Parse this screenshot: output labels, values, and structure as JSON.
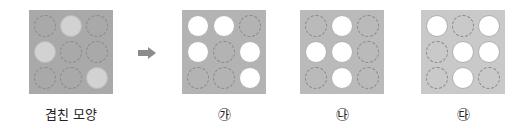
{
  "panels": [
    {
      "id": "overlap",
      "label": "겹친 모양",
      "bg": "#a9a9a9",
      "left": 29,
      "cells": [
        "hole",
        "light",
        "hole",
        "light",
        "hole",
        "hole",
        "hole",
        "hole",
        "light"
      ]
    },
    {
      "id": "ga",
      "label": "㉮",
      "bg": "#b3b3b3",
      "left": 182,
      "cells": [
        "open",
        "open",
        "hole",
        "open",
        "hole",
        "open",
        "hole",
        "hole",
        "open"
      ]
    },
    {
      "id": "na",
      "label": "㉯",
      "bg": "#bababa",
      "left": 300,
      "cells": [
        "hole",
        "open",
        "hole",
        "open",
        "open",
        "hole",
        "hole",
        "open",
        "hole"
      ]
    },
    {
      "id": "da",
      "label": "㉰",
      "bg": "#c9c9c9",
      "left": 421,
      "cells": [
        "open",
        "hole",
        "open",
        "hole",
        "open",
        "open",
        "hole",
        "open",
        "hole"
      ]
    }
  ],
  "arrow": {
    "icon": "right-arrow-icon",
    "color": "#8c8c8c"
  }
}
